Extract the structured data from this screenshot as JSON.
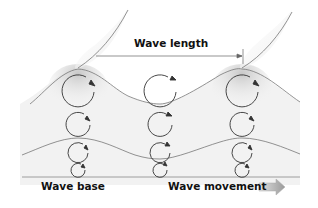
{
  "diagram": {
    "labels": {
      "wave_length": "Wave length",
      "wave_base": "Wave base",
      "wave_movement": "Wave movement"
    },
    "icons": {
      "movement_arrow": "right-arrow-icon"
    },
    "colors": {
      "line": "#777777",
      "orbit": "#333333",
      "shade": "#cfcfcf",
      "arrow_fill": "#b8b8b8",
      "text": "#111111"
    },
    "orbit_columns": [
      {
        "x": 78,
        "orbits": [
          {
            "cy": 92,
            "r": 16
          },
          {
            "cy": 125,
            "r": 12
          },
          {
            "cy": 153,
            "r": 10
          },
          {
            "cy": 170,
            "r": 7
          }
        ]
      },
      {
        "x": 160,
        "orbits": [
          {
            "cy": 92,
            "r": 16
          },
          {
            "cy": 125,
            "r": 12
          },
          {
            "cy": 153,
            "r": 10
          },
          {
            "cy": 170,
            "r": 7
          }
        ]
      },
      {
        "x": 242,
        "orbits": [
          {
            "cy": 92,
            "r": 16
          },
          {
            "cy": 125,
            "r": 12
          },
          {
            "cy": 153,
            "r": 10
          },
          {
            "cy": 170,
            "r": 7
          }
        ]
      }
    ]
  }
}
